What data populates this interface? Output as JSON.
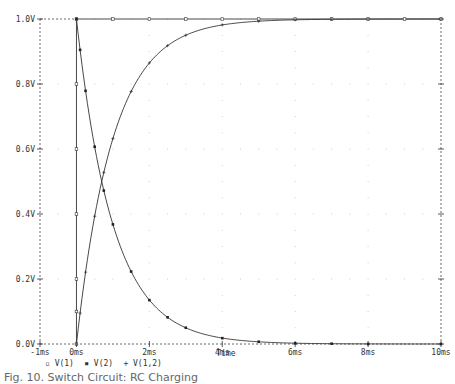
{
  "chart_data": {
    "type": "line",
    "title": "",
    "xlabel": "Time",
    "ylabel": "",
    "xlim": [
      -1,
      10
    ],
    "ylim": [
      0,
      1.0
    ],
    "x_unit": "ms",
    "y_unit": "V",
    "x_ticks": [
      "-1ms",
      "0ms",
      "2ms",
      "4ms",
      "6ms",
      "8ms",
      "10ms"
    ],
    "x_tick_values": [
      -1,
      0,
      2,
      4,
      6,
      8,
      10
    ],
    "y_ticks": [
      "0.0V",
      "0.2V",
      "0.4V",
      "0.6V",
      "0.8V",
      "1.0V"
    ],
    "y_tick_values": [
      0,
      0.2,
      0.4,
      0.6,
      0.8,
      1.0
    ],
    "grid": "dotted",
    "legend_position": "bottom-left",
    "series": [
      {
        "name": "V(1)",
        "marker": "square",
        "x": [
          0,
          0,
          0,
          0,
          0,
          0,
          0,
          1,
          2,
          3,
          4,
          5,
          6,
          7,
          8,
          9,
          10
        ],
        "y": [
          0,
          0.1,
          0.2,
          0.4,
          0.6,
          0.8,
          1.0,
          1.0,
          1.0,
          1.0,
          1.0,
          1.0,
          1.0,
          1.0,
          1.0,
          1.0,
          1.0
        ]
      },
      {
        "name": "V(2)",
        "marker": "filled-square",
        "x": [
          0,
          0.1,
          0.25,
          0.5,
          0.75,
          1.0,
          1.5,
          2.0,
          2.5,
          3.0,
          4.0,
          5.0,
          6.0,
          7.0,
          8.0,
          10.0
        ],
        "y": [
          1.0,
          0.905,
          0.779,
          0.607,
          0.472,
          0.368,
          0.223,
          0.135,
          0.082,
          0.05,
          0.018,
          0.007,
          0.002,
          0.001,
          0.0,
          0.0
        ]
      },
      {
        "name": "V(1,2)",
        "marker": "plus",
        "x": [
          0,
          0.1,
          0.25,
          0.5,
          0.75,
          1.0,
          1.5,
          2.0,
          2.5,
          3.0,
          4.0,
          5.0,
          6.0,
          7.0,
          8.0,
          10.0
        ],
        "y": [
          0.0,
          0.095,
          0.221,
          0.393,
          0.528,
          0.632,
          0.777,
          0.865,
          0.918,
          0.95,
          0.982,
          0.993,
          0.998,
          0.999,
          1.0,
          1.0
        ]
      }
    ]
  },
  "legend": {
    "items": [
      {
        "symbol": "▫",
        "label": "V(1)"
      },
      {
        "symbol": "▪",
        "label": "V(2)"
      },
      {
        "symbol": "+",
        "label": "V(1,2)"
      }
    ]
  },
  "caption": "Fig. 10. Switch Circuit: RC Charging"
}
